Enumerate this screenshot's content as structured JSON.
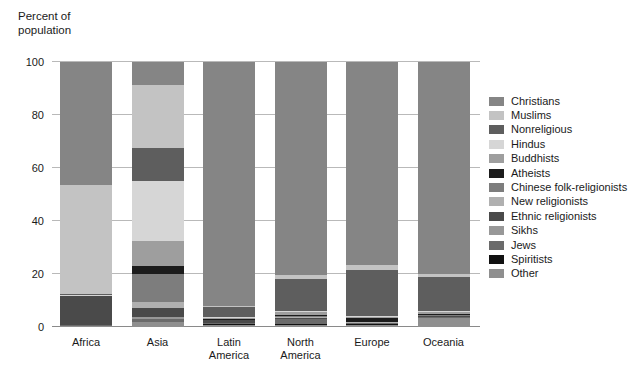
{
  "chart_data": {
    "type": "bar",
    "title": "",
    "subtitle": "",
    "stacked": true,
    "stack_total": 100,
    "ylabel": "Percent of\npopulation",
    "xlabel": "",
    "ylim": [
      0,
      100
    ],
    "yticks": [
      0,
      20,
      40,
      60,
      80,
      100
    ],
    "ytick_labels": [
      "0",
      "20",
      "40",
      "60",
      "80",
      "100"
    ],
    "grid": true,
    "legend_position": "right",
    "categories": [
      "Africa",
      "Asia",
      "Latin\nAmerica",
      "North\nAmerica",
      "Europe",
      "Oceania"
    ],
    "category_labels": [
      "Africa",
      "Asia",
      "Latin America",
      "North America",
      "Europe",
      "Oceania"
    ],
    "series": [
      {
        "name": "Christians",
        "color": "#858585",
        "values": [
          46.5,
          8.5,
          92.0,
          80.5,
          76.5,
          80.0
        ]
      },
      {
        "name": "Muslims",
        "color": "#c3c3c3",
        "values": [
          41.0,
          24.0,
          0.4,
          1.5,
          2.0,
          1.3
        ]
      },
      {
        "name": "Nonreligious",
        "color": "#5e5e5e",
        "values": [
          0.5,
          12.5,
          4.0,
          12.0,
          17.5,
          12.5
        ]
      },
      {
        "name": "Hindus",
        "color": "#d6d6d6",
        "values": [
          0.2,
          22.5,
          0.2,
          0.5,
          0.2,
          0.6
        ]
      },
      {
        "name": "Buddhists",
        "color": "#9e9e9e",
        "values": [
          0.1,
          9.5,
          0.2,
          0.8,
          0.3,
          0.5
        ]
      },
      {
        "name": "Atheists",
        "color": "#1c1c1c",
        "values": [
          0.1,
          3.0,
          0.4,
          0.6,
          1.6,
          0.5
        ]
      },
      {
        "name": "Chinese folk-religionists",
        "color": "#7d7d7d",
        "values": [
          0.0,
          10.5,
          0.1,
          0.2,
          0.1,
          0.2
        ]
      },
      {
        "name": "New religionists",
        "color": "#b0b0b0",
        "values": [
          0.0,
          2.2,
          0.1,
          0.3,
          0.1,
          0.2
        ]
      },
      {
        "name": "Ethnic religionists",
        "color": "#4a4a4a",
        "values": [
          11.0,
          3.5,
          1.0,
          0.4,
          0.1,
          0.3
        ]
      },
      {
        "name": "Sikhs",
        "color": "#989898",
        "values": [
          0.0,
          0.6,
          0.0,
          0.2,
          0.1,
          0.1
        ]
      },
      {
        "name": "Jews",
        "color": "#6b6b6b",
        "values": [
          0.1,
          1.2,
          0.3,
          1.8,
          0.4,
          0.3
        ]
      },
      {
        "name": "Spiritists",
        "color": "#111111",
        "values": [
          0.0,
          0.0,
          0.6,
          0.2,
          0.1,
          0.1
        ]
      },
      {
        "name": "Other",
        "color": "#8f8f8f",
        "values": [
          0.5,
          2.0,
          0.7,
          1.0,
          1.0,
          3.4
        ]
      }
    ]
  },
  "axis": {
    "y_title": "Percent of\npopulation"
  },
  "legend": {
    "items": [
      {
        "label": "Christians",
        "color": "#858585"
      },
      {
        "label": "Muslims",
        "color": "#c3c3c3"
      },
      {
        "label": "Nonreligious",
        "color": "#5e5e5e"
      },
      {
        "label": "Hindus",
        "color": "#d6d6d6"
      },
      {
        "label": "Buddhists",
        "color": "#9e9e9e"
      },
      {
        "label": "Atheists",
        "color": "#1c1c1c"
      },
      {
        "label": "Chinese folk-religionists",
        "color": "#7d7d7d"
      },
      {
        "label": "New religionists",
        "color": "#b0b0b0"
      },
      {
        "label": "Ethnic religionists",
        "color": "#4a4a4a"
      },
      {
        "label": "Sikhs",
        "color": "#989898"
      },
      {
        "label": "Jews",
        "color": "#6b6b6b"
      },
      {
        "label": "Spiritists",
        "color": "#111111"
      },
      {
        "label": "Other",
        "color": "#8f8f8f"
      }
    ]
  },
  "colors": {
    "background": "#ffffff",
    "gridline": "#b9b9b9",
    "axis": "#8a8a8a",
    "text": "#1a1a1a"
  }
}
